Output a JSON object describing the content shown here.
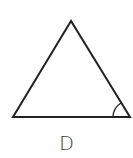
{
  "figure": {
    "label": "D",
    "shape": "triangle",
    "stroke_color": "#222222",
    "vertices": {
      "apex": [
        71,
        21
      ],
      "bottom_left": [
        13,
        117
      ],
      "bottom_right": [
        130,
        117
      ]
    },
    "angle_marker": {
      "vertex": "bottom_right",
      "type": "arc"
    }
  }
}
